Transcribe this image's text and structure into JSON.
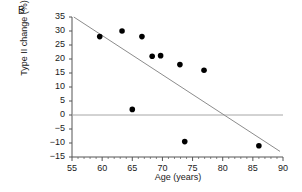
{
  "panel": {
    "label": "B"
  },
  "chart_data": {
    "type": "scatter",
    "title": "",
    "panel_label": "B",
    "xlabel": "Age (years)",
    "ylabel": "Type II change (%)",
    "xlim": [
      55,
      90
    ],
    "ylim": [
      -15,
      35
    ],
    "xticks": [
      55,
      60,
      65,
      70,
      75,
      80,
      85,
      90
    ],
    "xtick_labels": [
      "55",
      "60",
      "65",
      "70",
      "75",
      "80",
      "85",
      "90"
    ],
    "yticks": [
      -15,
      -10,
      -5,
      0,
      5,
      10,
      15,
      20,
      25,
      30,
      35
    ],
    "ytick_labels": [
      "-15",
      "-10",
      "-5",
      "0",
      "5",
      "10",
      "15",
      "20",
      "25",
      "30",
      "35"
    ],
    "x_minor_ticks": [
      56,
      57,
      58,
      59,
      61,
      62,
      63,
      64,
      66,
      67,
      68,
      69,
      71,
      72,
      73,
      74,
      76,
      77,
      78,
      79,
      81,
      82,
      83,
      84,
      86,
      87,
      88,
      89
    ],
    "grid": false,
    "legend": null,
    "points": [
      {
        "x": 59.6,
        "y": 28.0
      },
      {
        "x": 63.3,
        "y": 30.0
      },
      {
        "x": 66.6,
        "y": 28.0
      },
      {
        "x": 68.3,
        "y": 21.0
      },
      {
        "x": 69.7,
        "y": 21.2
      },
      {
        "x": 72.9,
        "y": 18.0
      },
      {
        "x": 76.9,
        "y": 16.0
      },
      {
        "x": 65.0,
        "y": 2.0
      },
      {
        "x": 73.7,
        "y": -9.5
      },
      {
        "x": 86.0,
        "y": -11.0
      }
    ],
    "marker": {
      "shape": "circle",
      "color": "#000000",
      "size_px": 5
    },
    "regression_line": {
      "x_start": 55.3,
      "y_start": 35.0,
      "x_end": 89.5,
      "y_end": -13.0,
      "color": "#8c8c8c"
    },
    "zero_reference_line": {
      "y": 0,
      "color": "#a6a6a6"
    },
    "axis_color": "#555555"
  }
}
